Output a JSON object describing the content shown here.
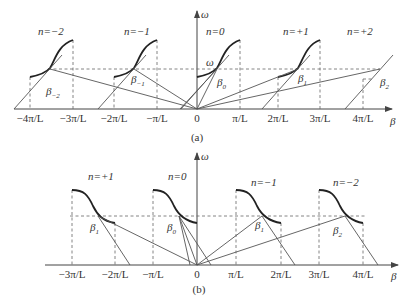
{
  "diagram_a": {
    "caption": "(a)",
    "y_axis_label": "ω",
    "x_axis_label": "β",
    "operating_point_label": "ω",
    "x_ticks": [
      "−4π/L",
      "−3π/L",
      "−2π/L",
      "−π/L",
      "0",
      "π/L",
      "2π/L",
      "3π/L",
      "4π/L"
    ],
    "harmonics": [
      {
        "n_label": "n=−2",
        "beta_base": "β",
        "beta_sub": "−2"
      },
      {
        "n_label": "n=−1",
        "beta_base": "β",
        "beta_sub": "−1"
      },
      {
        "n_label": "n=0",
        "beta_base": "β",
        "beta_sub": "0"
      },
      {
        "n_label": "n=+1",
        "beta_base": "β",
        "beta_sub": "1"
      },
      {
        "n_label": "n=+2",
        "beta_base": "β",
        "beta_sub": "2"
      }
    ]
  },
  "diagram_b": {
    "caption": "(b)",
    "y_axis_label": "ω",
    "x_axis_label": "β",
    "x_ticks": [
      "−3π/L",
      "−2π/L",
      "−π/L",
      "0",
      "π/L",
      "2π/L",
      "3π/L",
      "4π/L"
    ],
    "harmonics": [
      {
        "n_label": "n=+1",
        "beta_base": "β",
        "beta_sub": "1"
      },
      {
        "n_label": "n=0",
        "beta_base": "β",
        "beta_sub": "0"
      },
      {
        "n_label": "n=−1",
        "beta_base": "β",
        "beta_sub": "1"
      },
      {
        "n_label": "n=−2",
        "beta_base": "β",
        "beta_sub": "2"
      }
    ]
  }
}
